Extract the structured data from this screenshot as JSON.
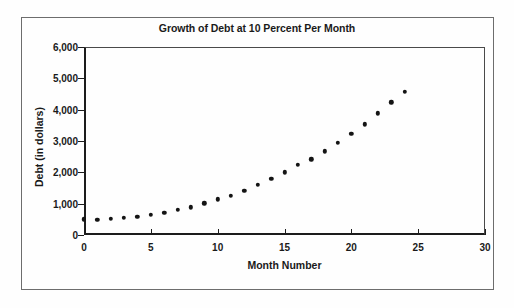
{
  "chart_data": {
    "type": "scatter",
    "title": "Growth of Debt at 10 Percent Per Month",
    "xlabel": "Month Number",
    "ylabel": "Debt (in dollars)",
    "xlim": [
      0,
      30
    ],
    "ylim": [
      0,
      6000
    ],
    "xticks": [
      0,
      5,
      10,
      15,
      20,
      25,
      30
    ],
    "xtick_labels": [
      "0",
      "5",
      "10",
      "15",
      "20",
      "25",
      "30"
    ],
    "yticks": [
      0,
      1000,
      2000,
      3000,
      4000,
      5000,
      6000
    ],
    "ytick_labels": [
      "0",
      "1,000",
      "2,000",
      "3,000",
      "4,000",
      "5,000",
      "6,000"
    ],
    "grid": false,
    "legend": false,
    "marker": "filled-circle",
    "marker_color": "#141414",
    "x": [
      0,
      1,
      2,
      3,
      4,
      5,
      6,
      7,
      8,
      9,
      10,
      11,
      12,
      13,
      14,
      15,
      16,
      17,
      18,
      19,
      20,
      21,
      22,
      23,
      24
    ],
    "y": [
      500,
      490,
      520,
      550,
      590,
      640,
      710,
      800,
      890,
      1010,
      1140,
      1260,
      1420,
      1600,
      1790,
      2000,
      2240,
      2420,
      2670,
      2950,
      3220,
      3530,
      3890,
      4230,
      4570
    ],
    "series": [
      {
        "name": "Debt",
        "values": [
          500,
          490,
          520,
          550,
          590,
          640,
          710,
          800,
          890,
          1010,
          1140,
          1260,
          1420,
          1600,
          1790,
          2000,
          2240,
          2420,
          2670,
          2950,
          3220,
          3530,
          3890,
          4230,
          4570
        ]
      }
    ]
  },
  "colors": {
    "marker": "#141414",
    "axis": "#1c1c1c",
    "frame": "#6d6d6d",
    "text": "#1a1a1a",
    "background": "#fefefe"
  }
}
